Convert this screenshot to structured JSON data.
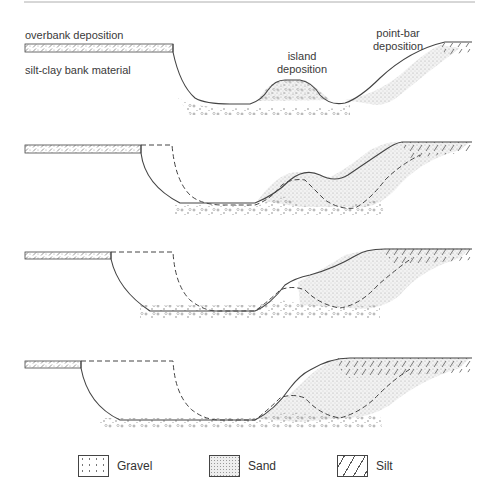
{
  "labels": {
    "overbank": "overbank deposition",
    "bank": "silt-clay bank material",
    "island": "island\ndeposition",
    "island_line1": "island",
    "island_line2": "deposition",
    "pointbar_line1": "point-bar",
    "pointbar_line2": "deposition"
  },
  "legend": {
    "items": [
      {
        "label": "Gravel",
        "pattern": "gravel-pattern"
      },
      {
        "label": "Sand",
        "pattern": "sand-pattern"
      },
      {
        "label": "Silt",
        "pattern": "silt-pattern"
      }
    ]
  },
  "colors": {
    "line": "#444444",
    "sand": "#d8d8d8",
    "background": "#ffffff"
  },
  "panels": [
    {
      "name": "stage-1"
    },
    {
      "name": "stage-2"
    },
    {
      "name": "stage-3"
    },
    {
      "name": "stage-4"
    }
  ]
}
